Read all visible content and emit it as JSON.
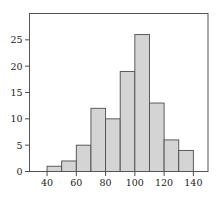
{
  "figure": {
    "background": "#ffffff",
    "bar_fill": "#d4d4d4",
    "bar_stroke": "#4d4d4d",
    "frame_color": "#555555",
    "tick_color": "#4d4d4d",
    "text_color": "#222222"
  },
  "chart_data": {
    "type": "bar",
    "subtype": "histogram",
    "title": "",
    "xlabel": "",
    "ylabel": "",
    "bin_start": 40,
    "bin_width": 10,
    "categories": [
      "40-50",
      "50-60",
      "60-70",
      "70-80",
      "80-90",
      "90-100",
      "100-110",
      "110-120",
      "120-130",
      "130-140"
    ],
    "values": [
      1,
      2,
      5,
      12,
      10,
      19,
      26,
      13,
      6,
      4
    ],
    "x_ticks": [
      40,
      60,
      80,
      100,
      120,
      140
    ],
    "y_ticks": [
      0,
      5,
      10,
      15,
      20,
      25
    ],
    "xlim": [
      28,
      150
    ],
    "ylim": [
      0,
      30
    ],
    "grid": false,
    "frame": true,
    "legend": "none"
  }
}
